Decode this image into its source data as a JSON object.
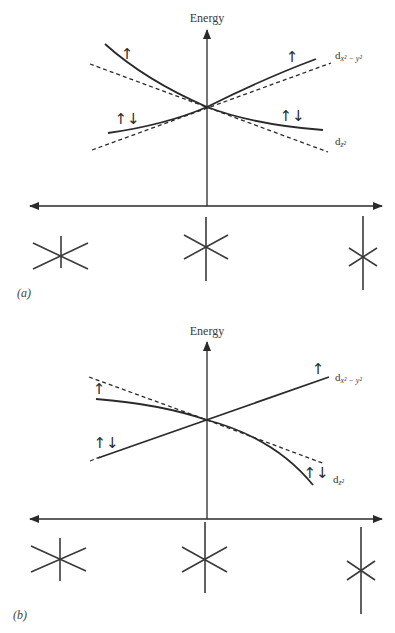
{
  "panels": [
    {
      "id": "a",
      "panel_label": "(a)",
      "y_axis_label": "Energy",
      "orbitals": {
        "upper": "d",
        "upper_sub": "x² − y²",
        "lower": "d",
        "lower_sub": "z²"
      },
      "spin_labels": {
        "left_upper": "↑",
        "left_lower": "↑↓",
        "right_upper": "↑",
        "right_lower": "↑↓"
      }
    },
    {
      "id": "b",
      "panel_label": "(b)",
      "y_axis_label": "Energy",
      "orbitals": {
        "upper": "d",
        "upper_sub": "x² − y²",
        "lower": "d",
        "lower_sub": "z²"
      },
      "spin_labels": {
        "left_upper": "↑",
        "left_lower": "↑↓",
        "right_upper": "↑",
        "right_lower": "↑↓"
      }
    }
  ],
  "icons": {
    "geometry_left": "compressed-octahedron-icon",
    "geometry_center": "octahedron-icon",
    "geometry_right": "elongated-octahedron-icon"
  }
}
